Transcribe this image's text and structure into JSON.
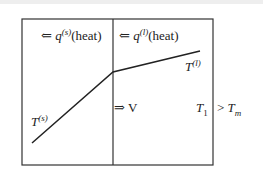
{
  "diagram": {
    "labels": {
      "q_solid_arrow": "⇐",
      "q_solid": "q",
      "q_solid_sup": "(s)",
      "q_solid_heat": "(heat)",
      "q_liquid_arrow": "⇐",
      "q_liquid": "q",
      "q_liquid_sup": "(l)",
      "q_liquid_heat": "(heat)",
      "T_liquid": "T",
      "T_liquid_sup": "(l)",
      "T_solid": "T",
      "T_solid_sup": "(s)",
      "velocity_arrow": "⇒",
      "velocity": "V",
      "T1": "T",
      "T1_sub": "1",
      "gt": ">",
      "Tm": "T",
      "Tm_sub": "m"
    },
    "colors": {
      "line": "#222222",
      "background": "#ffffff"
    }
  }
}
